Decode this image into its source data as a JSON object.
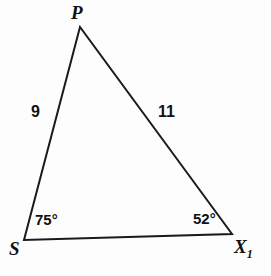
{
  "figure": {
    "kind": "triangle-diagram",
    "background_color": "#fdfdfd",
    "stroke_color": "#1a1a1a",
    "text_color": "#111111"
  },
  "vertices": {
    "apex": {
      "label": "P"
    },
    "bottom_left": {
      "label": "S"
    },
    "bottom_right": {
      "label": "X",
      "subscript": "1"
    }
  },
  "sides": {
    "left": {
      "length_label": "9"
    },
    "right": {
      "length_label": "11"
    }
  },
  "angles": {
    "at_s": {
      "measure_label": "75°"
    },
    "at_x": {
      "measure_label": "52°"
    }
  },
  "chart_data": {
    "type": "diagram",
    "shape": "triangle",
    "title": "",
    "points": [
      {
        "name": "P",
        "x": 80,
        "y": 27
      },
      {
        "name": "S",
        "x": 24,
        "y": 240
      },
      {
        "name": "X1",
        "x": 232,
        "y": 234
      }
    ],
    "edges": [
      {
        "from": "S",
        "to": "P",
        "label": "9"
      },
      {
        "from": "P",
        "to": "X1",
        "label": "11"
      },
      {
        "from": "S",
        "to": "X1",
        "label": ""
      }
    ],
    "angle_measures": [
      {
        "at": "S",
        "value": 75,
        "unit": "degrees",
        "label": "75°"
      },
      {
        "at": "X1",
        "value": 52,
        "unit": "degrees",
        "label": "52°"
      }
    ],
    "side_lengths": [
      {
        "edge": "SP",
        "value": 9
      },
      {
        "edge": "PX1",
        "value": 11
      }
    ]
  }
}
